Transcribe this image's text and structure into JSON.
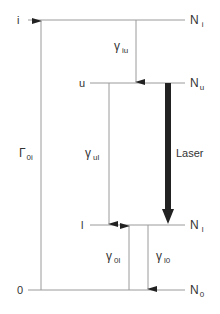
{
  "diagram": {
    "type": "energy-level-diagram",
    "levels": [
      {
        "id": "i",
        "label": "i",
        "population": "N",
        "population_sub": "i"
      },
      {
        "id": "u",
        "label": "u",
        "population": "N",
        "population_sub": "u"
      },
      {
        "id": "l",
        "label": "l",
        "population": "N",
        "population_sub": "l"
      },
      {
        "id": "0",
        "label": "0",
        "population": "N",
        "population_sub": "0"
      }
    ],
    "transitions": [
      {
        "id": "Gamma_0i",
        "symbol": "Γ",
        "sub": "0i",
        "from": "0",
        "to": "i"
      },
      {
        "id": "gamma_iu",
        "symbol": "γ",
        "sub": "iu",
        "from": "i",
        "to": "u"
      },
      {
        "id": "gamma_ul",
        "symbol": "γ",
        "sub": "ul",
        "from": "u",
        "to": "l"
      },
      {
        "id": "laser",
        "label": "Laser",
        "from": "u",
        "to": "l"
      },
      {
        "id": "gamma_0l",
        "symbol": "γ",
        "sub": "0l",
        "from": "0",
        "to": "l"
      },
      {
        "id": "gamma_l0",
        "symbol": "γ",
        "sub": "l0",
        "from": "l",
        "to": "0"
      }
    ]
  },
  "colors": {
    "line": "#9a9a9a",
    "text": "#333333",
    "laser": "#222222"
  }
}
